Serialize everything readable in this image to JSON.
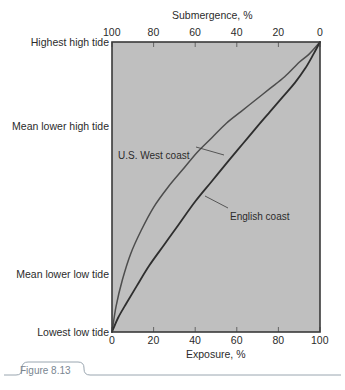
{
  "figure": {
    "caption": "Figure 8.13"
  },
  "chart_data": {
    "type": "line",
    "title": "",
    "xlabel": "Exposure, %",
    "ylabel": "",
    "top_axis_label": "Submergence, %",
    "xlim": [
      0,
      100
    ],
    "ylim": [
      0,
      100
    ],
    "grid": false,
    "legend_position": "inline-annotations",
    "bottom_ticks": [
      "0",
      "20",
      "40",
      "60",
      "80",
      "100"
    ],
    "bottom_tick_values": [
      0,
      20,
      40,
      60,
      80,
      100
    ],
    "top_ticks": [
      "100",
      "80",
      "60",
      "40",
      "20",
      "0"
    ],
    "top_tick_values": [
      100,
      80,
      60,
      40,
      20,
      0
    ],
    "y_tick_labels": [
      "Highest high tide",
      "Mean lower high tide",
      "Mean lower low tide",
      "Lowest low tide"
    ],
    "y_tick_positions": [
      100,
      71,
      20,
      0
    ],
    "plot_background_color": "#bfbfbf",
    "axis_color": "#3a3a3a",
    "series": [
      {
        "name": "U.S. West coast",
        "color": "#4d4d4d",
        "x": [
          0,
          2,
          5,
          9,
          14,
          20,
          27,
          34,
          41,
          48,
          55,
          62,
          69,
          76,
          83,
          90,
          95,
          100
        ],
        "y": [
          0,
          9,
          18,
          27,
          35,
          43,
          50,
          56,
          62,
          67,
          72,
          76,
          80,
          84,
          88,
          93,
          96,
          100
        ]
      },
      {
        "name": "English coast",
        "color": "#2e2e2e",
        "x": [
          0,
          3,
          7,
          12,
          18,
          25,
          32,
          40,
          48,
          56,
          63,
          70,
          76,
          82,
          88,
          93,
          97,
          100
        ],
        "y": [
          0,
          5,
          10,
          16,
          23,
          30,
          37,
          45,
          52,
          59,
          65,
          71,
          76,
          81,
          86,
          91,
          96,
          100
        ]
      }
    ],
    "annotations": [
      {
        "text": "U.S. West coast",
        "label_x": 118,
        "label_y": 150,
        "leader_from_x": 196,
        "leader_from_y": 147,
        "leader_to_x": 224,
        "leader_to_y": 155
      },
      {
        "text": "English coast",
        "label_x": 230,
        "label_y": 211,
        "leader_from_x": 228,
        "leader_from_y": 208,
        "leader_to_x": 205,
        "leader_to_y": 196
      }
    ]
  }
}
